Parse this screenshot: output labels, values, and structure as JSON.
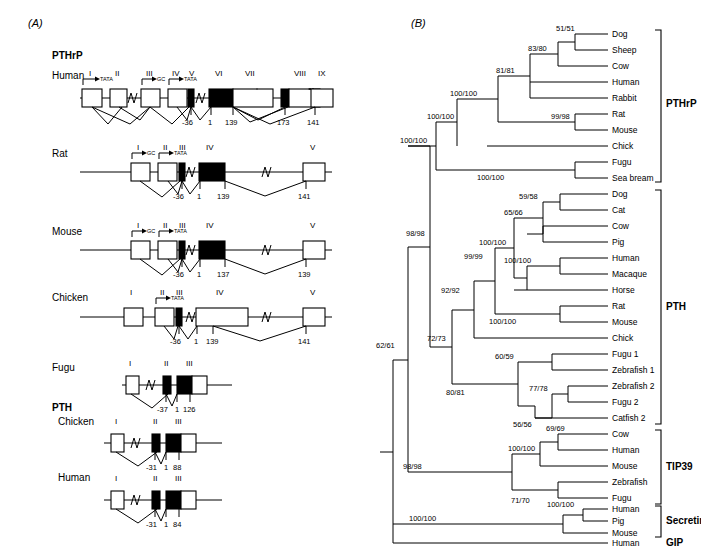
{
  "figure": {
    "panel_a_label": "(A)",
    "panel_b_label": "(B)"
  },
  "panel_a": {
    "group_headers": [
      {
        "id": "pthrp",
        "label": "PTHrP"
      },
      {
        "id": "pth",
        "label": "PTH"
      }
    ],
    "genes": [
      {
        "id": "pthrp-human",
        "species": "Human",
        "exon_labels": [
          "I",
          "II",
          "III",
          "IV",
          "V",
          "VI",
          "VII",
          "VIII",
          "IX"
        ],
        "promoters": [
          "TATA",
          "GC",
          "TATA"
        ],
        "numbers": [
          "-36",
          "1",
          "139",
          "173",
          "141"
        ]
      },
      {
        "id": "pthrp-rat",
        "species": "Rat",
        "exon_labels": [
          "I",
          "II",
          "III",
          "IV",
          "V"
        ],
        "promoters": [
          "GC",
          "TATA"
        ],
        "numbers": [
          "-36",
          "1",
          "139",
          "141"
        ]
      },
      {
        "id": "pthrp-mouse",
        "species": "Mouse",
        "exon_labels": [
          "I",
          "II",
          "III",
          "IV",
          "V"
        ],
        "promoters": [
          "GC",
          "TATA"
        ],
        "numbers": [
          "-36",
          "1",
          "137",
          "139"
        ]
      },
      {
        "id": "pthrp-chicken",
        "species": "Chicken",
        "exon_labels": [
          "I",
          "II",
          "III",
          "IV",
          "V"
        ],
        "promoters": [
          "TATA"
        ],
        "numbers": [
          "-36",
          "1",
          "139",
          "141"
        ]
      },
      {
        "id": "pthrp-fugu",
        "species": "Fugu",
        "exon_labels": [
          "I",
          "II",
          "III"
        ],
        "promoters": [],
        "numbers": [
          "-37",
          "1",
          "126"
        ]
      },
      {
        "id": "pth-chicken",
        "species": "Chicken",
        "exon_labels": [
          "I",
          "II",
          "III"
        ],
        "promoters": [],
        "numbers": [
          "-31",
          "1",
          "88"
        ]
      },
      {
        "id": "pth-human",
        "species": "Human",
        "exon_labels": [
          "I",
          "II",
          "III"
        ],
        "promoters": [],
        "numbers": [
          "-31",
          "1",
          "84"
        ]
      }
    ]
  },
  "panel_b": {
    "leaves": [
      "Dog",
      "Sheep",
      "Cow",
      "Human",
      "Rabbit",
      "Rat",
      "Mouse",
      "Chick",
      "Fugu",
      "Sea bream",
      "Dog",
      "Cat",
      "Cow",
      "Pig",
      "Human",
      "Macaque",
      "Horse",
      "Rat",
      "Mouse",
      "Chick",
      "Fugu 1",
      "Zebrafish 1",
      "Zebrafish 2",
      "Fugu 2",
      "Catfish 2",
      "Cow",
      "Human",
      "Mouse",
      "Zebrafish",
      "Fugu",
      "Human",
      "Pig",
      "Mouse",
      "Human"
    ],
    "bootstrap": [
      "51/51",
      "83/80",
      "81/81",
      "100/100",
      "99/98",
      "100/100",
      "100/100",
      "100/100",
      "59/58",
      "65/66",
      "100/100",
      "100/100",
      "99/99",
      "100/100",
      "92/92",
      "60/59",
      "77/78",
      "56/56",
      "80/81",
      "72/73",
      "98/98",
      "62/61",
      "69/69",
      "100/100",
      "71/70",
      "98/98",
      "100/100",
      "100/100"
    ],
    "clades": [
      {
        "id": "pthrp",
        "label": "PTHrP"
      },
      {
        "id": "pth",
        "label": "PTH"
      },
      {
        "id": "tip39",
        "label": "TIP39"
      },
      {
        "id": "secretin",
        "label": "Secretin"
      },
      {
        "id": "gip",
        "label": "GIP"
      }
    ]
  }
}
